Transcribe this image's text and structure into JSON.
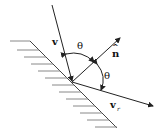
{
  "diagram": {
    "labels": {
      "incident_velocity": "v",
      "normal": "n",
      "normal_hat": "^",
      "angle_incident": "θ",
      "angle_reflected": "θ",
      "reflected_velocity": "v",
      "reflected_subscript": "r"
    },
    "colors": {
      "line": "#222222",
      "hatch": "#777777",
      "background": "#ffffff"
    }
  }
}
